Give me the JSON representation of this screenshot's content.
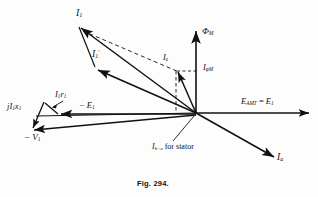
{
  "figure": {
    "caption": "Fig. 294.",
    "type": "phasor-diagram",
    "background": "#fdfdfd",
    "stroke": "#111111"
  },
  "labels": {
    "i1": "I",
    "i1_sub": "1",
    "i1_prime": "I",
    "i1_prime_sub": "1",
    "i1_prime_mark": "'",
    "iz": "I",
    "iz_sub": "z",
    "iphim": "I",
    "iphim_sub": "φM",
    "phim": "Φ",
    "phim_sub": "M",
    "eamt": "E",
    "eamt_sub": "AMT",
    "eamt_eq": " = ",
    "eamt_e1": "E",
    "eamt_e1_sub": "1",
    "minus_e1": "− E",
    "minus_e1_sub": "1",
    "minus_v1": "− V",
    "minus_v1_sub": "1",
    "i1r1": "I",
    "i1r1_sub1": "1",
    "i1r1_r": "r",
    "i1r1_sub2": "1",
    "ji1x1_j": "j",
    "ji1x1_i": "I",
    "ji1x1_sub1": "1",
    "ji1x1_x": "x",
    "ji1x1_sub2": "1",
    "ihe": "I",
    "ihe_sub": "h+e",
    "ihe_text": " for stator",
    "ia": "I",
    "ia_sub": "a"
  },
  "geometry": {
    "origin": {
      "x": 196,
      "y": 113
    },
    "axes": {
      "horizontal_tip": {
        "x": 312,
        "y": 113
      },
      "vertical_tip": {
        "x": 196,
        "y": 27
      },
      "horizontal_left_end": {
        "x": 36,
        "y": 116
      }
    },
    "vectors": [
      {
        "name": "I1",
        "from": {
          "x": 196,
          "y": 113
        },
        "to": {
          "x": 79,
          "y": 26
        }
      },
      {
        "name": "I1-prime",
        "from": {
          "x": 196,
          "y": 113
        },
        "to": {
          "x": 96,
          "y": 69
        }
      },
      {
        "name": "Iz",
        "from": {
          "x": 196,
          "y": 113
        },
        "to": {
          "x": 176,
          "y": 70
        }
      },
      {
        "name": "minus-E1",
        "from": {
          "x": 196,
          "y": 114
        },
        "to": {
          "x": 58,
          "y": 114
        }
      },
      {
        "name": "minus-V1",
        "from": {
          "x": 196,
          "y": 115
        },
        "to": {
          "x": 31,
          "y": 131
        }
      },
      {
        "name": "I1x1",
        "from": {
          "x": 58,
          "y": 114
        },
        "to": {
          "x": 44,
          "y": 102
        }
      },
      {
        "name": "jI1x1",
        "from": {
          "x": 44,
          "y": 102
        },
        "to": {
          "x": 31,
          "y": 131
        }
      },
      {
        "name": "Ia",
        "from": {
          "x": 196,
          "y": 113
        },
        "to": {
          "x": 277,
          "y": 159
        }
      },
      {
        "name": "PhiM",
        "from": {
          "x": 196,
          "y": 113
        },
        "to": {
          "x": 196,
          "y": 27
        }
      },
      {
        "name": "E-AMT",
        "from": {
          "x": 196,
          "y": 113
        },
        "to": {
          "x": 312,
          "y": 113
        }
      }
    ],
    "dashed": [
      {
        "name": "I1-to-Iz-construction",
        "from": {
          "x": 82,
          "y": 31
        },
        "to": {
          "x": 180,
          "y": 73
        }
      },
      {
        "name": "Iz-vertical-drop",
        "from": {
          "x": 176,
          "y": 70
        },
        "to": {
          "x": 176,
          "y": 113
        }
      },
      {
        "name": "Iz-horizontal-tick",
        "from": {
          "x": 176,
          "y": 70
        },
        "to": {
          "x": 196,
          "y": 70
        }
      },
      {
        "name": "Ihe-leader",
        "from": {
          "x": 193,
          "y": 116
        },
        "to": {
          "x": 172,
          "y": 142
        }
      },
      {
        "name": "I1r1-leader",
        "from": {
          "x": 62,
          "y": 102
        },
        "to": {
          "x": 51,
          "y": 108
        }
      }
    ]
  }
}
